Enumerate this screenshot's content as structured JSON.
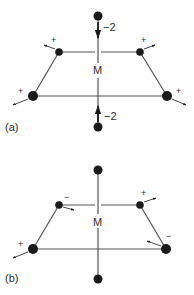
{
  "colors": {
    "ink": "#1a1a1a",
    "bond": "#555555",
    "background": "#ffffff"
  },
  "panels": [
    {
      "label": "(a)",
      "center_label": "M",
      "axial_top": {
        "charge": "−2"
      },
      "axial_bottom": {
        "charge": "−2"
      },
      "equatorial": {
        "back_left": "+",
        "back_right": "+",
        "front_left": "+",
        "front_right": "+"
      }
    },
    {
      "label": "(b)",
      "center_label": "M",
      "equatorial": {
        "back_left": "−",
        "back_right": "+",
        "front_left": "+",
        "front_right": "−"
      }
    }
  ]
}
